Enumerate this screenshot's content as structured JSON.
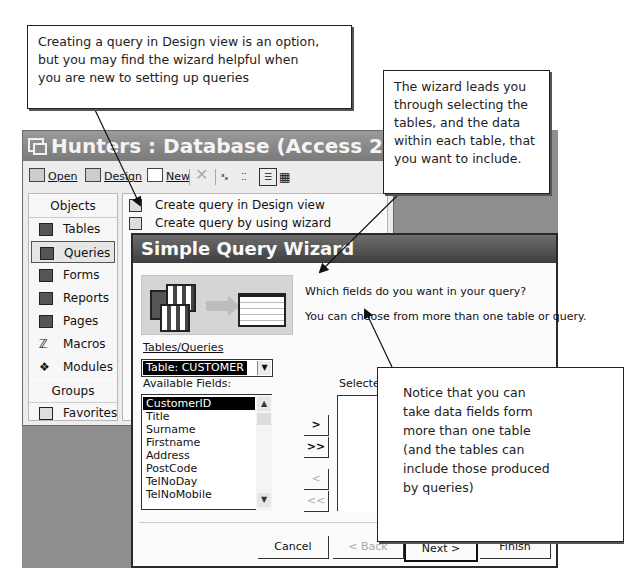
{
  "callouts": {
    "design_view_note": {
      "lines": [
        "Creating a query in Design view is an option,",
        "but you may find the wizard helpful when",
        "you are new to setting up queries"
      ]
    },
    "wizard_note": {
      "lines": [
        "The wizard leads you",
        "through selecting the",
        "tables, and the data",
        "within each table, that",
        "you want to include."
      ]
    },
    "multiple_tables_note": {
      "lines": [
        "Notice that you can",
        "take data fields form",
        "more than one table",
        "(and the tables can",
        "include those produced",
        "by queries)"
      ]
    }
  },
  "database_window": {
    "title": "Hunters : Database (Access 2000 file f...",
    "toolbar": {
      "open": "Open",
      "design": "Design",
      "new": "New",
      "delete_icon": "delete-x-icon",
      "view_icons": [
        "large-icons-icon",
        "small-icons-icon",
        "list-icon",
        "details-icon"
      ]
    },
    "objects_header": "Objects",
    "objects": [
      {
        "label": "Tables",
        "icon": "table-icon"
      },
      {
        "label": "Queries",
        "icon": "query-icon",
        "selected": true
      },
      {
        "label": "Forms",
        "icon": "form-icon"
      },
      {
        "label": "Reports",
        "icon": "report-icon"
      },
      {
        "label": "Pages",
        "icon": "page-icon"
      },
      {
        "label": "Macros",
        "icon": "macro-icon"
      },
      {
        "label": "Modules",
        "icon": "module-icon"
      }
    ],
    "groups_header": "Groups",
    "groups": [
      {
        "label": "Favorites",
        "icon": "favorites-folder-icon"
      }
    ],
    "query_items": [
      {
        "label": "Create query in Design view",
        "icon": "wand-icon"
      },
      {
        "label": "Create query by using wizard",
        "icon": "wand-icon"
      }
    ]
  },
  "wizard": {
    "title": "Simple Query Wizard",
    "prompt": "Which fields do you want in your query?",
    "hint": "You can choose from more than one table or query.",
    "tables_queries_label": "Tables/Queries",
    "tables_queries_value": "Table: CUSTOMER",
    "available_fields_label": "Available Fields:",
    "available_fields": [
      "CustomerID",
      "Title",
      "Surname",
      "Firstname",
      "Address",
      "PostCode",
      "TelNoDay",
      "TelNoMobile"
    ],
    "selected_index": 0,
    "selected_fields_label": "Selected",
    "move_buttons": {
      "add": ">",
      "add_all": ">>",
      "remove": "<",
      "remove_all": "<<"
    },
    "buttons": {
      "cancel": "Cancel",
      "back": "< Back",
      "next": "Next >",
      "finish": "Finish"
    }
  },
  "colors": {
    "backdrop": "#8e8e8e",
    "title_bar": "#4a4a4a",
    "selection": "#000000"
  }
}
